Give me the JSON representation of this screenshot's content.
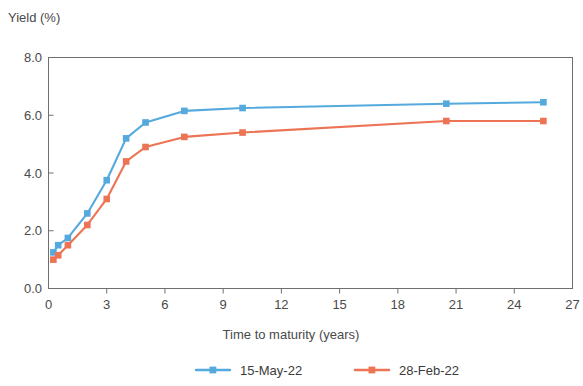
{
  "chart_data": {
    "type": "line",
    "title": "",
    "ylabel": "Yield (%)",
    "xlabel": "Time to maturity (years)",
    "xlim": [
      0,
      27
    ],
    "ylim": [
      0,
      8
    ],
    "xticks": [
      0,
      3,
      6,
      9,
      12,
      15,
      18,
      21,
      24,
      27
    ],
    "xtick_labels": [
      "0",
      "3",
      "6",
      "9",
      "12",
      "15",
      "18",
      "21",
      "24",
      "27"
    ],
    "yticks": [
      0,
      2,
      4,
      6,
      8
    ],
    "ytick_labels": [
      "0.0",
      "2.0",
      "4.0",
      "6.0",
      "8.0"
    ],
    "grid": false,
    "legend_position": "bottom",
    "series": [
      {
        "name": "15-May-22",
        "color": "#55a9dd",
        "marker": "square",
        "x": [
          0.25,
          0.5,
          1,
          2,
          3,
          4,
          5,
          7,
          10,
          20.5,
          25.5
        ],
        "values": [
          1.25,
          1.5,
          1.75,
          2.6,
          3.75,
          5.2,
          5.75,
          6.15,
          6.25,
          6.4,
          6.45
        ]
      },
      {
        "name": "28-Feb-22",
        "color": "#ed7355",
        "marker": "square",
        "x": [
          0.25,
          0.5,
          1,
          2,
          3,
          4,
          5,
          7,
          10,
          20.5,
          25.5
        ],
        "values": [
          1.0,
          1.15,
          1.5,
          2.2,
          3.1,
          4.4,
          4.9,
          5.25,
          5.4,
          5.8,
          5.8
        ]
      }
    ]
  },
  "legend": {
    "items": [
      {
        "label": "15-May-22",
        "color": "#55a9dd"
      },
      {
        "label": "28-Feb-22",
        "color": "#ed7355"
      }
    ]
  }
}
